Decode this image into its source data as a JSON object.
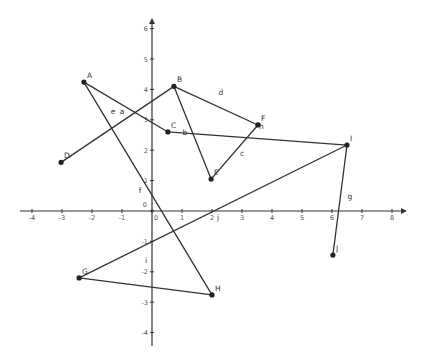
{
  "figure": {
    "type": "geometry-construction",
    "colors": {
      "background": "#ffffff",
      "axis": "#333333",
      "segment": "#333333",
      "point": "#222222",
      "label": "#333333"
    },
    "axes": {
      "x": {
        "min": -4,
        "max": 8,
        "ticks": [
          "-4",
          "-3",
          "-2",
          "-1",
          "0",
          "1",
          "2",
          "3",
          "4",
          "5",
          "6",
          "7",
          "8"
        ]
      },
      "y": {
        "min": -4,
        "max": 6,
        "ticks": [
          "-4",
          "-3",
          "-2",
          "-1",
          "0",
          "1",
          "2",
          "3",
          "4",
          "5",
          "6"
        ]
      },
      "origin_label": "0"
    },
    "points": [
      {
        "name": "A",
        "x": -2.27,
        "y": 4.24
      },
      {
        "name": "B",
        "x": 0.73,
        "y": 4.1
      },
      {
        "name": "C",
        "x": 0.53,
        "y": 2.6
      },
      {
        "name": "D",
        "x": -3.03,
        "y": 1.6
      },
      {
        "name": "E",
        "x": 1.97,
        "y": 1.05
      },
      {
        "name": "F",
        "x": 3.53,
        "y": 2.83
      },
      {
        "name": "G",
        "x": -2.43,
        "y": -2.2
      },
      {
        "name": "H",
        "x": 2.0,
        "y": -2.76
      },
      {
        "name": "I",
        "x": 6.5,
        "y": 2.17
      },
      {
        "name": "J",
        "x": 6.03,
        "y": -1.45
      }
    ],
    "segments": [
      {
        "name": "a",
        "from": "A",
        "to": "C",
        "label_x": -1.0,
        "label_y": 3.2
      },
      {
        "name": "b",
        "from": "C",
        "to": "I",
        "label_x": 1.1,
        "label_y": 2.5
      },
      {
        "name": "c",
        "from": "E",
        "to": "F",
        "label_x": 3.0,
        "label_y": 1.8
      },
      {
        "name": "d",
        "from": "B",
        "to": "F",
        "label_x": 2.3,
        "label_y": 3.8
      },
      {
        "name": "e",
        "from": "D",
        "to": "B",
        "label_x": -1.3,
        "label_y": 3.2
      },
      {
        "name": "f",
        "from": "A",
        "to": "H",
        "label_x": -0.4,
        "label_y": 0.6
      },
      {
        "name": "g",
        "from": "I",
        "to": "J",
        "label_x": 6.6,
        "label_y": 0.38
      },
      {
        "name": "h",
        "from": "B",
        "to": "E",
        "label_x": 3.65,
        "label_y": 2.7
      },
      {
        "name": "i",
        "from": "G",
        "to": "H",
        "label_x": -0.2,
        "label_y": -1.7
      },
      {
        "name": "j",
        "from": "G",
        "to": "I",
        "label_x": 2.2,
        "label_y": -0.3
      }
    ]
  }
}
